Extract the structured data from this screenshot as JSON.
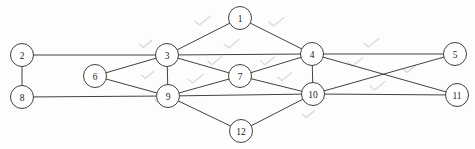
{
  "figure": {
    "kind": "undirected-graph-diagram",
    "background_color": "#fdfdfc",
    "stroke_color": "#2b2b2b",
    "node_fill_color": "#ffffff",
    "label_color": "#1a1a1a",
    "artifact_color": "#d9dadb",
    "width": 475,
    "height": 149,
    "node_radius": 11.5
  },
  "nodes": [
    {
      "id": "1",
      "label": "1",
      "x": 240,
      "y": 18
    },
    {
      "id": "2",
      "label": "2",
      "x": 22,
      "y": 55
    },
    {
      "id": "3",
      "label": "3",
      "x": 167,
      "y": 55
    },
    {
      "id": "4",
      "label": "4",
      "x": 312,
      "y": 54
    },
    {
      "id": "5",
      "label": "5",
      "x": 455,
      "y": 54
    },
    {
      "id": "6",
      "label": "6",
      "x": 95,
      "y": 76
    },
    {
      "id": "7",
      "label": "7",
      "x": 240,
      "y": 76
    },
    {
      "id": "8",
      "label": "8",
      "x": 22,
      "y": 97
    },
    {
      "id": "9",
      "label": "9",
      "x": 168,
      "y": 96
    },
    {
      "id": "10",
      "label": "10",
      "x": 313,
      "y": 94
    },
    {
      "id": "11",
      "label": "11",
      "x": 457,
      "y": 95
    },
    {
      "id": "12",
      "label": "12",
      "x": 241,
      "y": 131
    }
  ],
  "edges": [
    {
      "from": "1",
      "to": "3"
    },
    {
      "from": "1",
      "to": "4"
    },
    {
      "from": "2",
      "to": "3"
    },
    {
      "from": "2",
      "to": "8"
    },
    {
      "from": "3",
      "to": "4"
    },
    {
      "from": "3",
      "to": "6"
    },
    {
      "from": "3",
      "to": "7"
    },
    {
      "from": "3",
      "to": "9"
    },
    {
      "from": "4",
      "to": "5"
    },
    {
      "from": "4",
      "to": "7"
    },
    {
      "from": "4",
      "to": "10"
    },
    {
      "from": "4",
      "to": "11"
    },
    {
      "from": "5",
      "to": "10"
    },
    {
      "from": "6",
      "to": "9"
    },
    {
      "from": "7",
      "to": "9"
    },
    {
      "from": "7",
      "to": "10"
    },
    {
      "from": "8",
      "to": "9"
    },
    {
      "from": "9",
      "to": "10"
    },
    {
      "from": "9",
      "to": "12"
    },
    {
      "from": "10",
      "to": "11"
    },
    {
      "from": "10",
      "to": "12"
    }
  ],
  "artifacts": [
    {
      "x": 203,
      "y": 22,
      "scale": 1.0
    },
    {
      "x": 277,
      "y": 23,
      "scale": 1.0
    },
    {
      "x": 232,
      "y": 45,
      "scale": 1.0
    },
    {
      "x": 146,
      "y": 45,
      "scale": 0.8
    },
    {
      "x": 215,
      "y": 62,
      "scale": 0.9
    },
    {
      "x": 268,
      "y": 62,
      "scale": 0.9
    },
    {
      "x": 148,
      "y": 76,
      "scale": 0.8
    },
    {
      "x": 196,
      "y": 80,
      "scale": 1.0
    },
    {
      "x": 285,
      "y": 78,
      "scale": 0.9
    },
    {
      "x": 372,
      "y": 44,
      "scale": 1.0
    },
    {
      "x": 356,
      "y": 63,
      "scale": 1.0
    },
    {
      "x": 410,
      "y": 70,
      "scale": 0.8
    },
    {
      "x": 378,
      "y": 87,
      "scale": 1.0
    },
    {
      "x": 309,
      "y": 115,
      "scale": 0.8
    },
    {
      "x": 160,
      "y": 100,
      "scale": 0.7
    }
  ]
}
